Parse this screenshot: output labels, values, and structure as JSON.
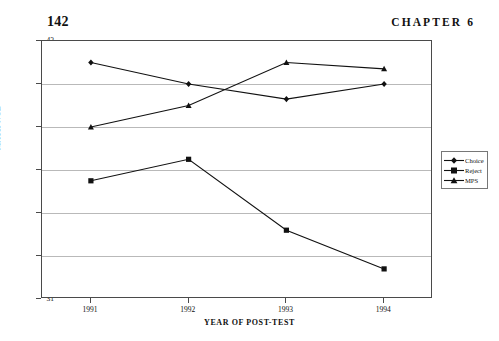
{
  "page": {
    "number": "142",
    "chapter_label": "CHAPTER 6"
  },
  "chart_data": {
    "type": "line",
    "title": "",
    "xlabel": "YEAR OF POST-TEST",
    "ylabel": "MATH NCE",
    "categories": [
      "1991",
      "1992",
      "1993",
      "1994"
    ],
    "ylim": [
      31,
      43
    ],
    "yticks": [
      "43",
      "41",
      "39",
      "37",
      "35",
      "33",
      "31"
    ],
    "ytick_values": [
      43,
      41,
      39,
      37,
      35,
      33,
      31
    ],
    "grid": true,
    "legend_position": "right",
    "series": [
      {
        "name": "Choice",
        "marker": "diamond",
        "values": [
          42.0,
          41.0,
          40.3,
          41.0
        ]
      },
      {
        "name": "Reject",
        "marker": "square",
        "values": [
          36.5,
          37.5,
          34.2,
          32.4
        ]
      },
      {
        "name": "MPS",
        "marker": "triangle",
        "values": [
          39.0,
          40.0,
          42.0,
          41.7
        ]
      }
    ]
  },
  "legend": {
    "items": [
      {
        "label": "Choice"
      },
      {
        "label": "Reject"
      },
      {
        "label": "MPS"
      }
    ]
  },
  "colors": {
    "line": "#111111",
    "grid": "#b9b9b9",
    "frame": "#4a4a4a"
  }
}
